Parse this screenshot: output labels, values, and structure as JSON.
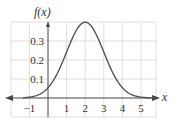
{
  "chart_data": {
    "type": "line",
    "title": "",
    "xlabel": "x",
    "ylabel": "f(x)",
    "xlim": [
      -1.5,
      5.9
    ],
    "ylim": [
      0,
      0.4
    ],
    "grid": true,
    "x_ticks": [
      "−1",
      "1",
      "2",
      "3",
      "4",
      "5"
    ],
    "y_ticks": [
      "0.1",
      "0.2",
      "0.3"
    ],
    "series": [
      {
        "name": "f(x)",
        "description": "Normal density curve, mean 2, std dev 1",
        "mean": 2,
        "sd": 1,
        "x": [
          -1.5,
          -1,
          -0.5,
          0,
          0.5,
          1,
          1.5,
          2,
          2.5,
          3,
          3.5,
          4,
          4.5,
          5,
          5.5,
          5.9
        ],
        "values": [
          0.001,
          0.004,
          0.018,
          0.054,
          0.13,
          0.242,
          0.352,
          0.399,
          0.352,
          0.242,
          0.13,
          0.054,
          0.018,
          0.004,
          0.001,
          0.0002
        ]
      }
    ],
    "color": "#555555"
  },
  "labels": {
    "ylabel": "f(x)",
    "xlabel": "x",
    "xticks": [
      {
        "v": -1,
        "t": "−1"
      },
      {
        "v": 1,
        "t": "1"
      },
      {
        "v": 2,
        "t": "2"
      },
      {
        "v": 3,
        "t": "3"
      },
      {
        "v": 4,
        "t": "4"
      },
      {
        "v": 5,
        "t": "5"
      }
    ],
    "yticks": [
      {
        "v": 0.1,
        "t": "0.1"
      },
      {
        "v": 0.2,
        "t": "0.2"
      },
      {
        "v": 0.3,
        "t": "0.3"
      }
    ]
  }
}
